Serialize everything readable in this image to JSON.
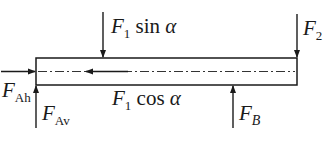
{
  "diagram": {
    "type": "free-body diagram of beam",
    "colors": {
      "line": "#1a1a1a",
      "background": "#ffffff"
    },
    "beam": {
      "x": 36,
      "y": 58,
      "width": 261,
      "height": 27,
      "centerline": "dash-dot"
    },
    "forces": [
      {
        "id": "F1sin",
        "symbol": "F",
        "sub": "1",
        "suffix": " sin ",
        "greek": "α",
        "direction": "down",
        "x": 103
      },
      {
        "id": "F2",
        "symbol": "F",
        "sub": "2",
        "direction": "down",
        "x": 297
      },
      {
        "id": "FAh",
        "symbol": "F",
        "sub": "Ah",
        "direction": "right",
        "y": 71
      },
      {
        "id": "FAv",
        "symbol": "F",
        "sub": "Av",
        "direction": "up",
        "x": 36
      },
      {
        "id": "F1cos",
        "symbol": "F",
        "sub": "1",
        "suffix": " cos ",
        "greek": "α",
        "direction": "left",
        "y": 71
      },
      {
        "id": "FB",
        "symbol": "F",
        "sub": "B",
        "direction": "up",
        "x": 233
      }
    ]
  }
}
